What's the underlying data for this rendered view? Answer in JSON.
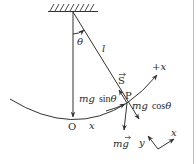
{
  "figure": {
    "type": "pendulum-force-diagram",
    "colors": {
      "line": "#333333",
      "text": "#2a2a2a",
      "background": "#ffffff",
      "border": "#bdbdbd"
    },
    "labels": {
      "theta": "θ",
      "length": "l",
      "tension_S": "S",
      "point_P": "P",
      "plus_x": "+x",
      "mg_sin_prefix": "mg",
      "mg_sin_fn": "sin",
      "mg_sin_theta": "θ",
      "mg_cos_prefix": "mg",
      "mg_cos_fn": "cos",
      "mg_cos_theta": "θ",
      "weight": "mg",
      "origin_O": "O",
      "arc_x": "x",
      "axis_y": "y",
      "axis_x": "x"
    }
  }
}
